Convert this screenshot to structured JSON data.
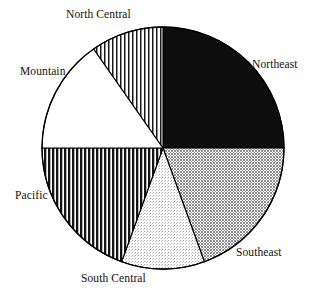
{
  "chart_data": {
    "type": "pie",
    "title": "",
    "subtitle": "",
    "xlabel": "",
    "ylabel": "",
    "legend_position": "none",
    "grid": false,
    "label_placement": "outside",
    "start_angle_deg": 0,
    "direction": "clockwise",
    "center": {
      "x": 163,
      "y": 148
    },
    "radius": 121,
    "categories": [
      "Northeast",
      "Southeast",
      "South Central",
      "Pacific",
      "Mountain",
      "North Central"
    ],
    "values": [
      25.0,
      19.4,
      11.1,
      19.4,
      15.3,
      9.7
    ],
    "slices": [
      {
        "label": "Northeast",
        "value": 25.0,
        "angle_deg": 90,
        "start_deg": 0,
        "end_deg": 90,
        "fill_style": "solid-black",
        "fill_color": "#0d0d0d",
        "stroke_color": "#000000"
      },
      {
        "label": "Southeast",
        "value": 19.4,
        "angle_deg": 70,
        "start_deg": 90,
        "end_deg": 160,
        "fill_style": "medium-gray-crosshatch",
        "fill_color": "#9a9a9a",
        "stroke_color": "#000000"
      },
      {
        "label": "South Central",
        "value": 11.1,
        "angle_deg": 40,
        "start_deg": 160,
        "end_deg": 200,
        "fill_style": "light-dotted",
        "fill_color": "#d8d8d8",
        "stroke_color": "#000000"
      },
      {
        "label": "Pacific",
        "value": 19.4,
        "angle_deg": 70,
        "start_deg": 200,
        "end_deg": 270,
        "fill_style": "vertical-stripes-heavy",
        "fill_color": "#2b2b2b",
        "stroke_color": "#000000"
      },
      {
        "label": "Mountain",
        "value": 15.3,
        "angle_deg": 55,
        "start_deg": 270,
        "end_deg": 325,
        "fill_style": "white-blank",
        "fill_color": "#ffffff",
        "stroke_color": "#000000"
      },
      {
        "label": "North Central",
        "value": 9.7,
        "angle_deg": 35,
        "start_deg": 325,
        "end_deg": 360,
        "fill_style": "vertical-stripes-fine",
        "fill_color": "#4a4a4a",
        "stroke_color": "#000000"
      }
    ],
    "labels": {
      "north_central": "North Central",
      "northeast": "Northeast",
      "mountain": "Mountain",
      "pacific": "Pacific",
      "southeast": "Southeast",
      "south_central": "South Central"
    }
  }
}
